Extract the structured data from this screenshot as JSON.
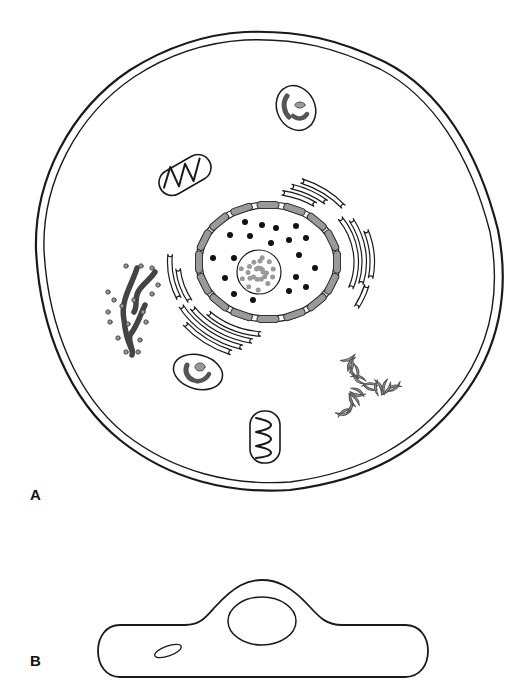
{
  "figure": {
    "panels": [
      {
        "id": "A",
        "label": "A",
        "view": "cell-top-view"
      },
      {
        "id": "B",
        "label": "B",
        "view": "cell-side-view"
      }
    ],
    "colors": {
      "stroke": "#1a1a1a",
      "organelle_fill": "#9a9a9a",
      "background": "#ffffff"
    },
    "structures": [
      {
        "name": "plasma-membrane",
        "depiction": "double outline"
      },
      {
        "name": "nucleus",
        "depiction": "nuclear envelope of grey segments with dark chromatin dots"
      },
      {
        "name": "nucleolus",
        "depiction": "circle filled with grey dots"
      },
      {
        "name": "golgi-apparatus",
        "depiction": "curved stacked cisternae around nucleus"
      },
      {
        "name": "rough-endoplasmic-reticulum",
        "depiction": "grey tubules studded with ribosomes"
      },
      {
        "name": "mitochondrion",
        "count": 2,
        "depiction": "capsule with zig-zag cristae"
      },
      {
        "name": "lysosome",
        "count": 2,
        "depiction": "oval with grey inclusions"
      },
      {
        "name": "granule-cluster",
        "depiction": "cluster of grey crescent granules"
      }
    ]
  }
}
